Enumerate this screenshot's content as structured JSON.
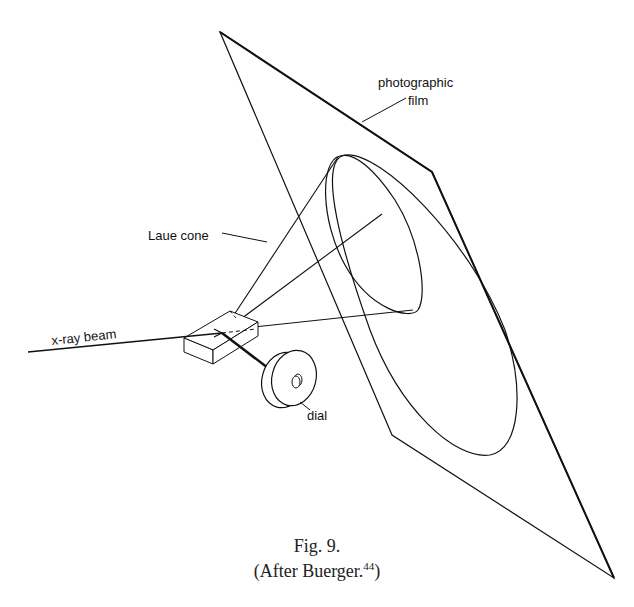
{
  "figure": {
    "caption_line1": "Fig. 9.",
    "caption_line2_prefix": "(After Buerger.",
    "caption_line2_superscript": "44",
    "caption_line2_suffix": ")"
  },
  "labels": {
    "film": [
      "photographic",
      "film"
    ],
    "cone": "Laue cone",
    "beam": "x-ray beam",
    "dial": "dial"
  },
  "colors": {
    "line": "#111111",
    "background": "#ffffff"
  }
}
